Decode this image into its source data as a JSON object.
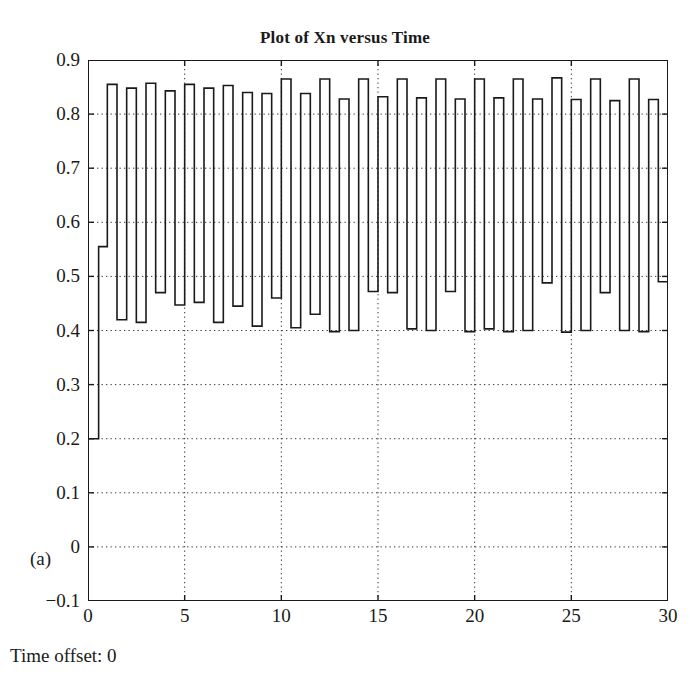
{
  "figure": {
    "title": "Plot of Xn versus Time",
    "panel_label": "(a)",
    "caption_below": "Time offset: 0"
  },
  "chart_data": {
    "type": "line",
    "title": "Plot of Xn versus Time",
    "subtitle": "",
    "xlabel": "",
    "ylabel": "",
    "annotations": [
      "(a)",
      "Time offset: 0"
    ],
    "legend": [],
    "legend_position": "none",
    "grid": true,
    "grid_style": "dotted",
    "line_color": "#1a1a1a",
    "line_width": 1.6,
    "drawstyle": "steps-post",
    "xlim": [
      0,
      30
    ],
    "ylim": [
      -0.1,
      0.9
    ],
    "xticks": [
      0,
      5,
      10,
      15,
      20,
      25,
      30
    ],
    "xtick_labels": [
      "0",
      "5",
      "10",
      "15",
      "20",
      "25",
      "30"
    ],
    "yticks": [
      -0.1,
      0,
      0.1,
      0.2,
      0.3,
      0.4,
      0.5,
      0.6,
      0.7,
      0.8,
      0.9
    ],
    "ytick_labels": [
      "−0.1",
      "0",
      "0.1",
      "0.2",
      "0.3",
      "0.4",
      "0.5",
      "0.6",
      "0.7",
      "0.8",
      "0.9"
    ],
    "series": [
      {
        "name": "Xn",
        "x": [
          0,
          0.55,
          1,
          1.5,
          2,
          2.5,
          3,
          3.5,
          4,
          4.5,
          5,
          5.5,
          6,
          6.5,
          7,
          7.5,
          8,
          8.5,
          9,
          9.5,
          10,
          10.5,
          11,
          11.5,
          12,
          12.5,
          13,
          13.5,
          14,
          14.5,
          15,
          15.5,
          16,
          16.5,
          17,
          17.5,
          18,
          18.5,
          19,
          19.5,
          20,
          20.5,
          21,
          21.5,
          22,
          22.5,
          23,
          23.5,
          24,
          24.5,
          25,
          25.5,
          26,
          26.5,
          27,
          27.5,
          28,
          28.5,
          29,
          29.5,
          30
        ],
        "y": [
          0.2,
          0.555,
          0.855,
          0.42,
          0.848,
          0.415,
          0.857,
          0.47,
          0.843,
          0.447,
          0.855,
          0.452,
          0.848,
          0.415,
          0.853,
          0.445,
          0.84,
          0.408,
          0.838,
          0.46,
          0.865,
          0.405,
          0.838,
          0.43,
          0.865,
          0.398,
          0.828,
          0.4,
          0.865,
          0.472,
          0.832,
          0.47,
          0.865,
          0.403,
          0.83,
          0.4,
          0.865,
          0.472,
          0.828,
          0.398,
          0.865,
          0.403,
          0.83,
          0.398,
          0.865,
          0.4,
          0.828,
          0.488,
          0.867,
          0.397,
          0.827,
          0.4,
          0.865,
          0.47,
          0.825,
          0.4,
          0.865,
          0.398,
          0.827,
          0.49,
          0.49
        ]
      }
    ]
  }
}
